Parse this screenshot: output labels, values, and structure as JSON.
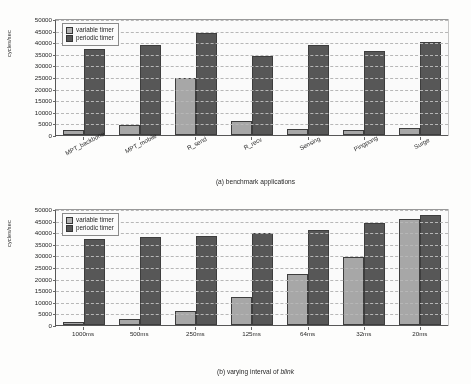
{
  "figure": {
    "ylabel": "cycles/sec",
    "legend": {
      "variable": "variable timer",
      "periodic": "periodic timer"
    },
    "colors": {
      "variable": "#a9a9a9",
      "periodic": "#555555",
      "axis": "#555555",
      "grid": "#b9b9b9",
      "background": "#ffffff"
    },
    "yticks": [
      "50000",
      "45000",
      "40000",
      "35000",
      "30000",
      "25000",
      "20000",
      "15000",
      "10000",
      "5000",
      "0"
    ]
  },
  "chart_data": [
    {
      "type": "bar",
      "id": "a",
      "title": "",
      "caption_prefix": "(a) benchmark applications",
      "caption_italic": "",
      "caption_suffix": "",
      "xlabel": "",
      "ylabel": "cycles/sec",
      "ylim": [
        0,
        50000
      ],
      "ytick_step": 5000,
      "grid": true,
      "legend_position": "top-left",
      "xtick_rotation": -28,
      "categories": [
        "MPT_backbone",
        "MPT_mobile",
        "R_send",
        "R_recv",
        "Sensing",
        "Pingpong",
        "Surge"
      ],
      "series": [
        {
          "name": "variable timer",
          "values": [
            2200,
            4500,
            24400,
            6100,
            2500,
            2200,
            3200
          ]
        },
        {
          "name": "periodic timer",
          "values": [
            37000,
            38800,
            43900,
            34100,
            38800,
            36300,
            39900
          ]
        }
      ]
    },
    {
      "type": "bar",
      "id": "b",
      "title": "",
      "caption_prefix": "(b) varying interval of ",
      "caption_italic": "blink",
      "caption_suffix": "",
      "xlabel": "",
      "ylabel": "cycles/sec",
      "ylim": [
        0,
        50000
      ],
      "ytick_step": 5000,
      "grid": true,
      "legend_position": "top-left",
      "xtick_rotation": 0,
      "categories": [
        "1000ms",
        "500ms",
        "250ms",
        "125ms",
        "64ms",
        "32ms",
        "20ms"
      ],
      "series": [
        {
          "name": "variable timer",
          "values": [
            1500,
            2500,
            6000,
            12200,
            22000,
            29400,
            45500
          ]
        },
        {
          "name": "periodic timer",
          "values": [
            37200,
            38000,
            38400,
            39500,
            41100,
            43900,
            47500
          ]
        }
      ]
    }
  ]
}
